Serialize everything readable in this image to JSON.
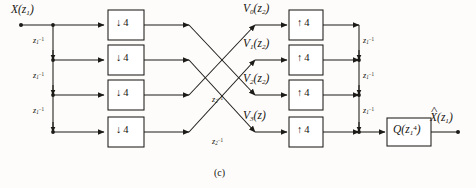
{
  "figure": {
    "caption": "(c)",
    "input_label": "X(z₁)",
    "output_label": "X̂(z₁)"
  },
  "signals": {
    "input": {
      "base": "X",
      "arg": "z",
      "arg_sub": "1"
    },
    "output": {
      "base": "X",
      "arg": "z",
      "arg_sub": "1",
      "hat": true
    },
    "v": [
      {
        "name": "V",
        "index": "0",
        "arg": "z",
        "arg_sub": "2",
        "text": "V₀(z₂)"
      },
      {
        "name": "V",
        "index": "1",
        "arg": "z",
        "arg_sub": "2",
        "text": "V₁(z₂)"
      },
      {
        "name": "V",
        "index": "2",
        "arg": "z",
        "arg_sub": "2",
        "text": "V₂(z₂)"
      },
      {
        "name": "V",
        "index": "3",
        "arg": "z",
        "arg_sub": "",
        "text": "V₃(z)"
      }
    ]
  },
  "blocks": {
    "downsamplers": [
      {
        "label": "↓4",
        "arrow": "↓",
        "factor": "4"
      },
      {
        "label": "↓4",
        "arrow": "↓",
        "factor": "4"
      },
      {
        "label": "↓4",
        "arrow": "↓",
        "factor": "4"
      },
      {
        "label": "↓4",
        "arrow": "↓",
        "factor": "4"
      }
    ],
    "upsamplers": [
      {
        "label": "↑4",
        "arrow": "↑",
        "factor": "4"
      },
      {
        "label": "↑4",
        "arrow": "↑",
        "factor": "4"
      },
      {
        "label": "↑4",
        "arrow": "↑",
        "factor": "4"
      },
      {
        "label": "↑4",
        "arrow": "↑",
        "factor": "4"
      }
    ],
    "quantizer": {
      "text": "Q(z₁⁴)",
      "base": "Q",
      "var": "z",
      "var_sub": "1",
      "var_sup": "4"
    }
  },
  "delays": {
    "input_chain": [
      {
        "text": "z₁⁻¹",
        "var": "z",
        "sub": "1",
        "sup": "-1"
      },
      {
        "text": "z₁⁻¹",
        "var": "z",
        "sub": "1",
        "sup": "-1"
      },
      {
        "text": "z₁⁻¹",
        "var": "z",
        "sub": "1",
        "sup": "-1"
      }
    ],
    "cross_section": [
      {
        "text": "z₂⁻¹",
        "var": "z",
        "sub": "2",
        "sup": "-1"
      },
      {
        "text": "z₂⁻¹",
        "var": "z",
        "sub": "2",
        "sup": "-1"
      }
    ],
    "output_chain": [
      {
        "text": "z₁⁻¹",
        "var": "z",
        "sub": "1",
        "sup": "-1"
      },
      {
        "text": "z₁⁻¹",
        "var": "z",
        "sub": "1",
        "sup": "-1"
      },
      {
        "text": "z₁⁻¹",
        "var": "z",
        "sub": "1",
        "sup": "-1"
      }
    ]
  },
  "colors": {
    "line": "#1d1b18",
    "background": "#fdfcfa",
    "text": "#15130f"
  }
}
